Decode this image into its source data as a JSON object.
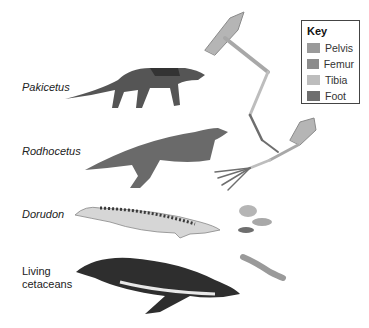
{
  "key": {
    "title": "Key",
    "items": [
      {
        "label": "Pelvis",
        "color": "#9a9a9a"
      },
      {
        "label": "Femur",
        "color": "#8c8c8c"
      },
      {
        "label": "Tibia",
        "color": "#bdbdbd"
      },
      {
        "label": "Foot",
        "color": "#6e6e6e"
      }
    ]
  },
  "organisms": [
    {
      "name": "Pakicetus"
    },
    {
      "name": "Rodhocetus"
    },
    {
      "name": "Dorudon"
    },
    {
      "name": "Living",
      "name2": "cetaceans"
    }
  ]
}
